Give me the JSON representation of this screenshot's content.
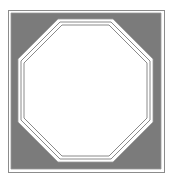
{
  "figure": {
    "description": "Octagon inscribed in a square frame",
    "canvas": {
      "width": 170,
      "height": 180,
      "background": "#ffffff"
    },
    "colors": {
      "outer_line": "#8c8c8c",
      "band_fill": "#7b7b7b",
      "band_edge": "#9a9a9a",
      "inner_line": "#8a8a8a",
      "octagon_fill": "#ffffff"
    },
    "outer_square": {
      "x1": 8,
      "y1": 10,
      "x2": 164,
      "y2": 172
    },
    "band_square": {
      "x1": 11,
      "y1": 13,
      "x2": 161,
      "y2": 169
    },
    "band_inner_octagon": {
      "x1": 18,
      "y1": 19,
      "x2": 153,
      "y2": 162,
      "cut": 40
    },
    "octagon_line_1": {
      "x1": 21,
      "y1": 22,
      "x2": 150,
      "y2": 159,
      "cut": 39
    },
    "octagon_line_2": {
      "x1": 24,
      "y1": 25,
      "x2": 147,
      "y2": 156,
      "cut": 38
    }
  }
}
